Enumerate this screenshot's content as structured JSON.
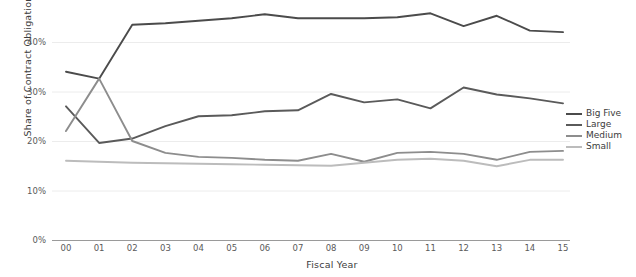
{
  "chart_data": {
    "type": "line",
    "title": "",
    "xlabel": "Fiscal Year",
    "ylabel": "Share of Contract Obligations",
    "categories": [
      "00",
      "01",
      "02",
      "03",
      "04",
      "05",
      "06",
      "07",
      "08",
      "09",
      "10",
      "11",
      "12",
      "13",
      "14",
      "15"
    ],
    "x_tick_labels": [
      "00",
      "01",
      "02",
      "03",
      "04",
      "05",
      "06",
      "07",
      "08",
      "09",
      "10",
      "11",
      "12",
      "13",
      "14",
      "15"
    ],
    "y_tick_labels": [
      "0%",
      "10%",
      "20%",
      "30%",
      "40%"
    ],
    "y_tick_values": [
      0,
      10,
      20,
      30,
      40
    ],
    "ylim": [
      0,
      50
    ],
    "xlim": [
      0,
      15
    ],
    "grid": "horizontal",
    "legend_position": "right",
    "series": [
      {
        "name": "Big Five",
        "color": "#4b4b4b",
        "values": [
          34.0,
          32.6,
          43.5,
          43.8,
          44.3,
          44.8,
          45.6,
          44.8,
          44.8,
          44.8,
          45.0,
          45.8,
          43.2,
          45.3,
          42.3,
          42.0
        ]
      },
      {
        "name": "Large",
        "color": "#5a5a5a",
        "values": [
          27.0,
          19.6,
          20.5,
          23.0,
          25.0,
          25.2,
          26.0,
          26.2,
          29.5,
          27.8,
          28.4,
          26.6,
          30.8,
          29.4,
          28.6,
          27.6
        ]
      },
      {
        "name": "Medium",
        "color": "#8d8d8d",
        "values": [
          22.0,
          32.6,
          20.0,
          17.6,
          16.8,
          16.6,
          16.2,
          16.0,
          17.4,
          15.8,
          17.6,
          17.8,
          17.4,
          16.2,
          17.8,
          18.0
        ]
      },
      {
        "name": "Small",
        "color": "#bcbcbc",
        "values": [
          16.0,
          15.8,
          15.6,
          15.5,
          15.4,
          15.3,
          15.2,
          15.1,
          15.0,
          15.6,
          16.2,
          16.4,
          16.0,
          14.9,
          16.2,
          16.2
        ]
      }
    ]
  },
  "legend": {
    "items": [
      {
        "label": "Big Five",
        "color": "#4b4b4b"
      },
      {
        "label": "Large",
        "color": "#5a5a5a"
      },
      {
        "label": "Medium",
        "color": "#8d8d8d"
      },
      {
        "label": "Small",
        "color": "#bcbcbc"
      }
    ]
  }
}
